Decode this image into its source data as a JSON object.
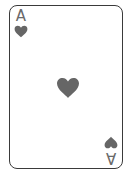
{
  "card": {
    "rank": "A",
    "suit": "hearts",
    "suit_icon": "heart-icon",
    "colors": {
      "border": "#3a3a3a",
      "pip": "#666666",
      "background": "#ffffff"
    }
  }
}
